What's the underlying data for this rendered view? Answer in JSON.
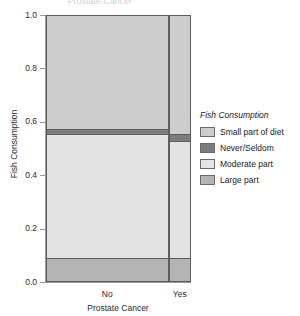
{
  "figure": {
    "title": "Prostate Cancer"
  },
  "axes": {
    "y": {
      "title": "Fish Consumption",
      "ticks": [
        "0.0",
        "0.2",
        "0.4",
        "0.6",
        "0.8",
        "1.0"
      ],
      "min": 0.0,
      "max": 1.0
    },
    "x": {
      "title": "Prostate Cancer",
      "ticks": [
        "No",
        "Yes"
      ]
    }
  },
  "legend": {
    "title": "Fish Consumption",
    "items": [
      {
        "label": "Small part of diet",
        "color": "#cdcdcd"
      },
      {
        "label": "Never/Seldom",
        "color": "#7d7d7d"
      },
      {
        "label": "Moderate part",
        "color": "#e3e3e3"
      },
      {
        "label": "Large part",
        "color": "#b4b4b4"
      }
    ]
  },
  "chart_data": {
    "type": "bar",
    "subtype": "mosaic-spine-plot",
    "title": "Prostate Cancer",
    "xlabel": "Prostate Cancer",
    "ylabel": "Fish Consumption",
    "ylim": [
      0.0,
      1.0
    ],
    "grid": false,
    "legend_position": "right",
    "categories": [
      "No",
      "Yes"
    ],
    "category_widths": [
      0.845,
      0.155
    ],
    "series": [
      {
        "name": "Small part of diet",
        "color": "#cdcdcd",
        "values": [
          0.425,
          0.445
        ]
      },
      {
        "name": "Never/Seldom",
        "color": "#7d7d7d",
        "values": [
          0.02,
          0.025
        ]
      },
      {
        "name": "Moderate part",
        "color": "#e3e3e3",
        "values": [
          0.47,
          0.445
        ]
      },
      {
        "name": "Large part",
        "color": "#b4b4b4",
        "values": [
          0.085,
          0.085
        ]
      }
    ]
  }
}
